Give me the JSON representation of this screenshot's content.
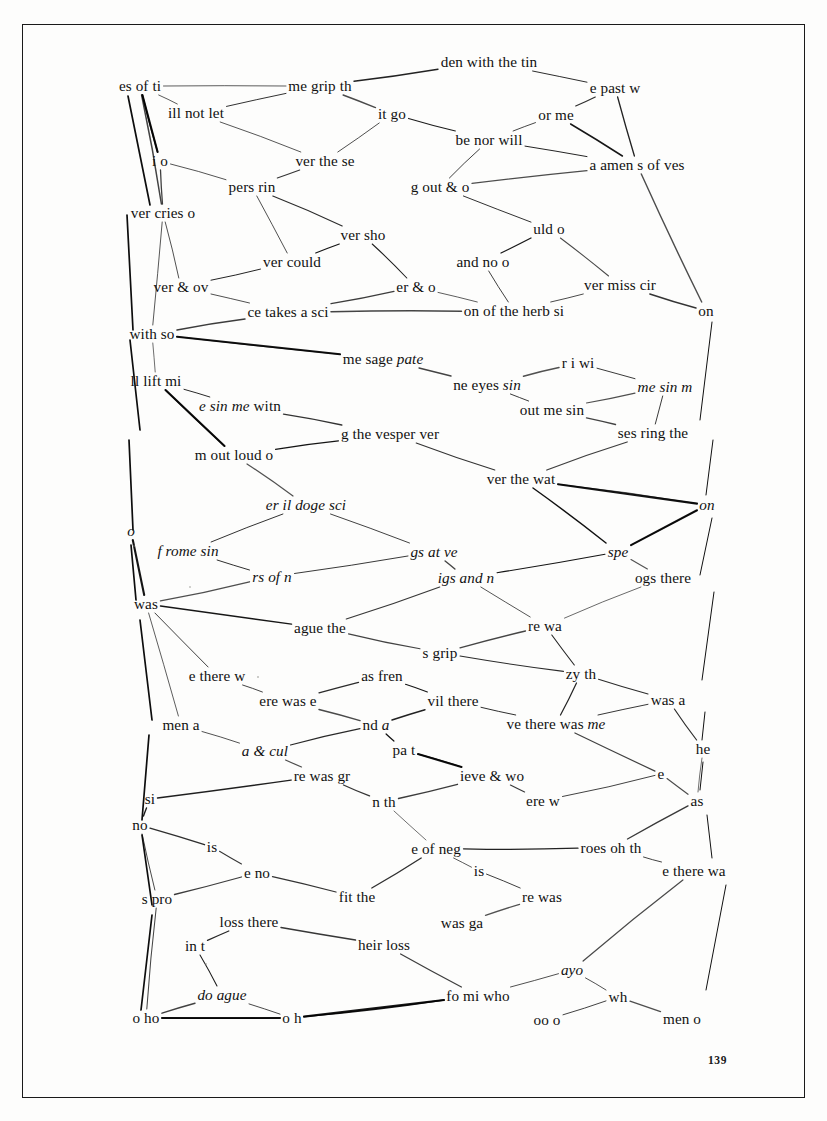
{
  "document": {
    "title": "Scanned book page with hand-drawn text-fragment network diagram",
    "page_number": "139",
    "ink_color": "#111111",
    "paper_color": "#fdfdfc",
    "border_color": "#1a1a1a"
  },
  "diagram": {
    "type": "node-link network of handwritten-cut text fragments",
    "nodes": [
      {
        "id": "n01",
        "text": "es of ti",
        "x": 140,
        "y": 86,
        "style": "roman"
      },
      {
        "id": "n02",
        "text": "den with the tin",
        "x": 489,
        "y": 62,
        "style": "roman"
      },
      {
        "id": "n03",
        "text": "me grip th",
        "x": 320,
        "y": 86,
        "style": "roman"
      },
      {
        "id": "n04",
        "text": "e past w",
        "x": 615,
        "y": 88,
        "style": "roman"
      },
      {
        "id": "n05",
        "text": "ill not let",
        "x": 196,
        "y": 113,
        "style": "roman"
      },
      {
        "id": "n06",
        "text": "it go",
        "x": 392,
        "y": 114,
        "style": "roman"
      },
      {
        "id": "n07",
        "text": "or me",
        "x": 556,
        "y": 115,
        "style": "roman"
      },
      {
        "id": "n08",
        "text": "be nor will",
        "x": 489,
        "y": 140,
        "style": "roman"
      },
      {
        "id": "n09",
        "text": "i o",
        "x": 160,
        "y": 161,
        "style": "roman"
      },
      {
        "id": "n10",
        "text": "ver the se",
        "x": 325,
        "y": 161,
        "style": "roman"
      },
      {
        "id": "n11",
        "text": "a amen s of ves",
        "x": 637,
        "y": 165,
        "style": "roman"
      },
      {
        "id": "n12",
        "text": "pers rin",
        "x": 252,
        "y": 187,
        "style": "roman"
      },
      {
        "id": "n13",
        "text": "g out & o",
        "x": 440,
        "y": 187,
        "style": "roman"
      },
      {
        "id": "n14",
        "text": "ver cries  o",
        "x": 163,
        "y": 213,
        "style": "roman"
      },
      {
        "id": "n15",
        "text": "ver sho",
        "x": 363,
        "y": 235,
        "style": "roman"
      },
      {
        "id": "n16",
        "text": "uld o",
        "x": 549,
        "y": 229,
        "style": "roman"
      },
      {
        "id": "n17",
        "text": "ver could",
        "x": 292,
        "y": 262,
        "style": "roman"
      },
      {
        "id": "n18",
        "text": "and no o",
        "x": 483,
        "y": 262,
        "style": "roman"
      },
      {
        "id": "n19",
        "text": "ver & ov",
        "x": 181,
        "y": 287,
        "style": "roman"
      },
      {
        "id": "n20",
        "text": "er & o",
        "x": 416,
        "y": 287,
        "style": "roman"
      },
      {
        "id": "n21",
        "text": "ver miss cir",
        "x": 620,
        "y": 285,
        "style": "roman"
      },
      {
        "id": "n22",
        "text": "ce takes a sci",
        "x": 288,
        "y": 312,
        "style": "roman"
      },
      {
        "id": "n23",
        "text": "on of the herb si",
        "x": 514,
        "y": 311,
        "style": "roman"
      },
      {
        "id": "n24",
        "text": "on",
        "x": 706,
        "y": 311,
        "style": "roman"
      },
      {
        "id": "n25",
        "text": "with so",
        "x": 152,
        "y": 334,
        "style": "roman"
      },
      {
        "id": "n26",
        "text": "me sage ",
        "x": 383,
        "y": 359,
        "style": "roman",
        "italic_tail": "pate"
      },
      {
        "id": "n27",
        "text": "r i wi",
        "x": 578,
        "y": 363,
        "style": "roman"
      },
      {
        "id": "n28",
        "text": "ll lift mi",
        "x": 156,
        "y": 381,
        "style": "roman"
      },
      {
        "id": "n29",
        "text": "ne eyes ",
        "x": 487,
        "y": 385,
        "style": "roman",
        "italic_tail": "sin"
      },
      {
        "id": "n30",
        "text": "me sin m",
        "x": 665,
        "y": 387,
        "style": "italic"
      },
      {
        "id": "n31",
        "text": "e sin me",
        "x": 240,
        "y": 406,
        "style": "italic",
        "roman_tail": " witn"
      },
      {
        "id": "n32",
        "text": "out me sin",
        "x": 552,
        "y": 410,
        "style": "roman"
      },
      {
        "id": "n33",
        "text": "g the vesper ver",
        "x": 390,
        "y": 434,
        "style": "roman"
      },
      {
        "id": "n34",
        "text": "ses ring the",
        "x": 653,
        "y": 433,
        "style": "roman"
      },
      {
        "id": "n35",
        "text": "m out loud o",
        "x": 234,
        "y": 455,
        "style": "roman"
      },
      {
        "id": "n36",
        "text": "ver the wat",
        "x": 521,
        "y": 479,
        "style": "roman"
      },
      {
        "id": "n37",
        "text": "er il doge sci",
        "x": 306,
        "y": 505,
        "style": "italic",
        "roman_head": "er "
      },
      {
        "id": "n38",
        "text": "on",
        "x": 707,
        "y": 505,
        "style": "italic"
      },
      {
        "id": "n39",
        "text": "o",
        "x": 131,
        "y": 531,
        "style": "italic"
      },
      {
        "id": "n40",
        "text": "f rome sin",
        "x": 188,
        "y": 551,
        "style": "italic"
      },
      {
        "id": "n41",
        "text": "gs at ve",
        "x": 434,
        "y": 552,
        "style": "italic"
      },
      {
        "id": "n42",
        "text": "spe",
        "x": 618,
        "y": 552,
        "style": "italic"
      },
      {
        "id": "n43",
        "text": "rs of n",
        "x": 272,
        "y": 577,
        "style": "italic"
      },
      {
        "id": "n44",
        "text": "igs and n",
        "x": 466,
        "y": 578,
        "style": "italic"
      },
      {
        "id": "n45",
        "text": "ogs there",
        "x": 663,
        "y": 578,
        "style": "roman",
        "italic_head": "ogs"
      },
      {
        "id": "n46",
        "text": "was",
        "x": 146,
        "y": 604,
        "style": "roman"
      },
      {
        "id": "n47",
        "text": "ague the",
        "x": 320,
        "y": 628,
        "style": "roman"
      },
      {
        "id": "n48",
        "text": "re wa",
        "x": 545,
        "y": 626,
        "style": "roman"
      },
      {
        "id": "n49",
        "text": "s grip",
        "x": 440,
        "y": 653,
        "style": "roman"
      },
      {
        "id": "n50",
        "text": "e there w",
        "x": 217,
        "y": 676,
        "style": "roman"
      },
      {
        "id": "n51",
        "text": "as fren",
        "x": 382,
        "y": 676,
        "style": "roman"
      },
      {
        "id": "n52",
        "text": "zy th",
        "x": 581,
        "y": 674,
        "style": "roman"
      },
      {
        "id": "n53",
        "text": "was a",
        "x": 668,
        "y": 700,
        "style": "roman"
      },
      {
        "id": "n54",
        "text": "ere was e",
        "x": 288,
        "y": 701,
        "style": "roman"
      },
      {
        "id": "n55",
        "text": "vil there",
        "x": 453,
        "y": 701,
        "style": "roman"
      },
      {
        "id": "n56",
        "text": "men a",
        "x": 181,
        "y": 725,
        "style": "roman"
      },
      {
        "id": "n57",
        "text": "nd a",
        "x": 376,
        "y": 725,
        "style": "roman",
        "italic_tail": "a"
      },
      {
        "id": "n58",
        "text": "ve there was me",
        "x": 556,
        "y": 724,
        "style": "roman",
        "italic_head": "ve",
        "italic_tail": "me"
      },
      {
        "id": "n59",
        "text": "a & cul",
        "x": 265,
        "y": 751,
        "style": "italic"
      },
      {
        "id": "n60",
        "text": "pa t",
        "x": 404,
        "y": 750,
        "style": "roman",
        "italic_head": "pa"
      },
      {
        "id": "n61",
        "text": "he",
        "x": 703,
        "y": 749,
        "style": "roman"
      },
      {
        "id": "n62",
        "text": "re was gr",
        "x": 322,
        "y": 776,
        "style": "roman"
      },
      {
        "id": "n63",
        "text": "ieve  & wo",
        "x": 492,
        "y": 776,
        "style": "roman"
      },
      {
        "id": "n64",
        "text": "e",
        "x": 661,
        "y": 774,
        "style": "roman"
      },
      {
        "id": "n65",
        "text": "si",
        "x": 150,
        "y": 799,
        "style": "roman"
      },
      {
        "id": "n66",
        "text": "n th",
        "x": 384,
        "y": 802,
        "style": "roman"
      },
      {
        "id": "n67",
        "text": "ere w",
        "x": 543,
        "y": 801,
        "style": "roman"
      },
      {
        "id": "n68",
        "text": "as",
        "x": 697,
        "y": 801,
        "style": "roman"
      },
      {
        "id": "n69",
        "text": "no",
        "x": 140,
        "y": 825,
        "style": "roman"
      },
      {
        "id": "n70",
        "text": "is",
        "x": 212,
        "y": 847,
        "style": "roman"
      },
      {
        "id": "n71",
        "text": "e of neg",
        "x": 436,
        "y": 849,
        "style": "roman"
      },
      {
        "id": "n72",
        "text": "roes oh th",
        "x": 611,
        "y": 848,
        "style": "roman"
      },
      {
        "id": "n73",
        "text": "e no",
        "x": 257,
        "y": 873,
        "style": "roman"
      },
      {
        "id": "n74",
        "text": "is",
        "x": 479,
        "y": 871,
        "style": "roman"
      },
      {
        "id": "n75",
        "text": "e there wa",
        "x": 694,
        "y": 871,
        "style": "roman"
      },
      {
        "id": "n76",
        "text": "s pro",
        "x": 157,
        "y": 899,
        "style": "roman"
      },
      {
        "id": "n77",
        "text": "fit the",
        "x": 357,
        "y": 897,
        "style": "roman"
      },
      {
        "id": "n78",
        "text": "re was",
        "x": 542,
        "y": 897,
        "style": "roman"
      },
      {
        "id": "n79",
        "text": "loss  there",
        "x": 249,
        "y": 922,
        "style": "roman"
      },
      {
        "id": "n80",
        "text": "was ga",
        "x": 462,
        "y": 923,
        "style": "roman"
      },
      {
        "id": "n81",
        "text": "in t",
        "x": 195,
        "y": 946,
        "style": "roman"
      },
      {
        "id": "n82",
        "text": "heir loss",
        "x": 384,
        "y": 945,
        "style": "roman"
      },
      {
        "id": "n83",
        "text": "ayo",
        "x": 572,
        "y": 970,
        "style": "italic"
      },
      {
        "id": "n84",
        "text": "do ague",
        "x": 222,
        "y": 995,
        "style": "italic"
      },
      {
        "id": "n85",
        "text": "fo mi who",
        "x": 478,
        "y": 996,
        "style": "roman",
        "italic_head": "fo mi"
      },
      {
        "id": "n86",
        "text": "wh",
        "x": 618,
        "y": 997,
        "style": "roman"
      },
      {
        "id": "n87",
        "text": "o ho",
        "x": 146,
        "y": 1018,
        "style": "roman"
      },
      {
        "id": "n88",
        "text": "o h",
        "x": 292,
        "y": 1018,
        "style": "roman"
      },
      {
        "id": "n89",
        "text": "oo o",
        "x": 547,
        "y": 1020,
        "style": "roman"
      },
      {
        "id": "n90",
        "text": "men o",
        "x": 682,
        "y": 1019,
        "style": "roman"
      }
    ],
    "edge_count": 118,
    "edges": [
      [
        "n01",
        "n03"
      ],
      [
        "n01",
        "n05"
      ],
      [
        "n01",
        "n09"
      ],
      [
        "n01",
        "n14"
      ],
      [
        "n03",
        "n02"
      ],
      [
        "n03",
        "n05"
      ],
      [
        "n03",
        "n06"
      ],
      [
        "n02",
        "n04"
      ],
      [
        "n06",
        "n10"
      ],
      [
        "n06",
        "n08"
      ],
      [
        "n08",
        "n07"
      ],
      [
        "n07",
        "n04"
      ],
      [
        "n07",
        "n11"
      ],
      [
        "n08",
        "n11"
      ],
      [
        "n04",
        "n11"
      ],
      [
        "n08",
        "n13"
      ],
      [
        "n05",
        "n10"
      ],
      [
        "n09",
        "n12"
      ],
      [
        "n09",
        "n14"
      ],
      [
        "n12",
        "n10"
      ],
      [
        "n12",
        "n15"
      ],
      [
        "n14",
        "n19"
      ],
      [
        "n14",
        "n25"
      ],
      [
        "n12",
        "n17"
      ],
      [
        "n17",
        "n15"
      ],
      [
        "n17",
        "n19"
      ],
      [
        "n19",
        "n22"
      ],
      [
        "n22",
        "n25"
      ],
      [
        "n15",
        "n20"
      ],
      [
        "n13",
        "n11"
      ],
      [
        "n13",
        "n16"
      ],
      [
        "n16",
        "n18"
      ],
      [
        "n16",
        "n21"
      ],
      [
        "n18",
        "n23"
      ],
      [
        "n23",
        "n20"
      ],
      [
        "n21",
        "n23"
      ],
      [
        "n21",
        "n24"
      ],
      [
        "n11",
        "n24"
      ],
      [
        "n20",
        "n22"
      ],
      [
        "n22",
        "n23"
      ],
      [
        "n25",
        "n26"
      ],
      [
        "n25",
        "n28"
      ],
      [
        "n28",
        "n31"
      ],
      [
        "n28",
        "n35"
      ],
      [
        "n26",
        "n29"
      ],
      [
        "n29",
        "n27"
      ],
      [
        "n27",
        "n30"
      ],
      [
        "n30",
        "n34"
      ],
      [
        "n29",
        "n32"
      ],
      [
        "n32",
        "n30"
      ],
      [
        "n31",
        "n33"
      ],
      [
        "n33",
        "n35"
      ],
      [
        "n33",
        "n36"
      ],
      [
        "n36",
        "n34"
      ],
      [
        "n32",
        "n34"
      ],
      [
        "n36",
        "n38"
      ],
      [
        "n36",
        "n42"
      ],
      [
        "n35",
        "n37"
      ],
      [
        "n37",
        "n40"
      ],
      [
        "n37",
        "n41"
      ],
      [
        "n40",
        "n43"
      ],
      [
        "n43",
        "n41"
      ],
      [
        "n41",
        "n44"
      ],
      [
        "n44",
        "n42"
      ],
      [
        "n42",
        "n38"
      ],
      [
        "n42",
        "n45"
      ],
      [
        "n43",
        "n46"
      ],
      [
        "n46",
        "n47"
      ],
      [
        "n47",
        "n44"
      ],
      [
        "n47",
        "n49"
      ],
      [
        "n49",
        "n48"
      ],
      [
        "n48",
        "n44"
      ],
      [
        "n48",
        "n45"
      ],
      [
        "n46",
        "n50"
      ],
      [
        "n46",
        "n56"
      ],
      [
        "n50",
        "n54"
      ],
      [
        "n54",
        "n51"
      ],
      [
        "n51",
        "n55"
      ],
      [
        "n49",
        "n52"
      ],
      [
        "n52",
        "n48"
      ],
      [
        "n52",
        "n53"
      ],
      [
        "n55",
        "n58"
      ],
      [
        "n58",
        "n52"
      ],
      [
        "n58",
        "n53"
      ],
      [
        "n53",
        "n61"
      ],
      [
        "n54",
        "n57"
      ],
      [
        "n57",
        "n55"
      ],
      [
        "n57",
        "n60"
      ],
      [
        "n56",
        "n59"
      ],
      [
        "n59",
        "n62"
      ],
      [
        "n59",
        "n57"
      ],
      [
        "n60",
        "n63"
      ],
      [
        "n62",
        "n66"
      ],
      [
        "n66",
        "n63"
      ],
      [
        "n63",
        "n67"
      ],
      [
        "n58",
        "n64"
      ],
      [
        "n64",
        "n67"
      ],
      [
        "n64",
        "n68"
      ],
      [
        "n61",
        "n68"
      ],
      [
        "n65",
        "n62"
      ],
      [
        "n65",
        "n69"
      ],
      [
        "n69",
        "n70"
      ],
      [
        "n70",
        "n73"
      ],
      [
        "n73",
        "n77"
      ],
      [
        "n73",
        "n76"
      ],
      [
        "n69",
        "n76"
      ],
      [
        "n66",
        "n71"
      ],
      [
        "n71",
        "n72"
      ],
      [
        "n71",
        "n74"
      ],
      [
        "n72",
        "n68"
      ],
      [
        "n72",
        "n75"
      ],
      [
        "n74",
        "n78"
      ],
      [
        "n78",
        "n80"
      ],
      [
        "n77",
        "n71"
      ],
      [
        "n76",
        "n87"
      ],
      [
        "n79",
        "n81"
      ],
      [
        "n79",
        "n82"
      ],
      [
        "n82",
        "n85"
      ],
      [
        "n84",
        "n87"
      ],
      [
        "n84",
        "n88"
      ],
      [
        "n87",
        "n88"
      ],
      [
        "n88",
        "n85"
      ],
      [
        "n85",
        "n83"
      ],
      [
        "n83",
        "n75"
      ],
      [
        "n83",
        "n86"
      ],
      [
        "n86",
        "n89"
      ],
      [
        "n86",
        "n90"
      ],
      [
        "n81",
        "n84"
      ]
    ]
  }
}
